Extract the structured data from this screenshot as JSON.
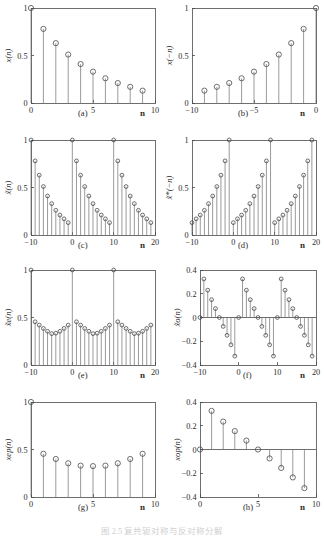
{
  "figure": {
    "caption": "图 2.5  复共轭对称与反对称分解",
    "xaxis_label": "n"
  },
  "panels": [
    {
      "id": "a",
      "sublabel": "(a)",
      "ylabel": "x(n)",
      "xlabel": "n",
      "xticks": [
        0,
        5,
        10
      ],
      "xticklabels": [
        "0",
        "5",
        "10"
      ],
      "yticks": [
        0,
        0.5,
        1
      ],
      "yticklabels": [
        "0",
        "0.5",
        "1"
      ],
      "xlim": [
        0,
        10
      ],
      "ylim": [
        0,
        1
      ]
    },
    {
      "id": "b",
      "sublabel": "(b)",
      "ylabel": "x(−n)",
      "xlabel": "n",
      "xticks": [
        -10,
        -5,
        0
      ],
      "xticklabels": [
        "−10",
        "−5",
        "0"
      ],
      "yticks": [
        0,
        0.5,
        1
      ],
      "yticklabels": [
        "0",
        "0.5",
        "1"
      ],
      "xlim": [
        -10,
        0
      ],
      "ylim": [
        0,
        1
      ]
    },
    {
      "id": "c",
      "sublabel": "(c)",
      "ylabel": "x̃(n)",
      "xlabel": "n",
      "xticks": [
        -10,
        0,
        10,
        20
      ],
      "xticklabels": [
        "−10",
        "0",
        "10",
        "20"
      ],
      "yticks": [
        0,
        0.5,
        1
      ],
      "yticklabels": [
        "0",
        "0.5",
        "1"
      ],
      "xlim": [
        -10,
        20
      ],
      "ylim": [
        0,
        1
      ]
    },
    {
      "id": "d",
      "sublabel": "(d)",
      "ylabel": "x̃*(−n)",
      "xlabel": "n",
      "xticks": [
        -10,
        0,
        10,
        20
      ],
      "xticklabels": [
        "−10",
        "0",
        "10",
        "20"
      ],
      "yticks": [
        0,
        0.5,
        1
      ],
      "yticklabels": [
        "0",
        "0.5",
        "1"
      ],
      "xlim": [
        -10,
        20
      ],
      "ylim": [
        0,
        1
      ]
    },
    {
      "id": "e",
      "sublabel": "(e)",
      "ylabel": "x̃e(n)",
      "xlabel": "n",
      "xticks": [
        -10,
        0,
        10,
        20
      ],
      "xticklabels": [
        "−10",
        "0",
        "10",
        "20"
      ],
      "yticks": [
        0,
        0.5,
        1
      ],
      "yticklabels": [
        "0",
        "0.5",
        "1"
      ],
      "xlim": [
        -10,
        20
      ],
      "ylim": [
        0,
        1
      ]
    },
    {
      "id": "f",
      "sublabel": "(f)",
      "ylabel": "x̃o(n)",
      "xlabel": "n",
      "xticks": [
        -10,
        0,
        10,
        20
      ],
      "xticklabels": [
        "−10",
        "0",
        "10",
        "20"
      ],
      "yticks": [
        -0.4,
        -0.2,
        0,
        0.2,
        0.4
      ],
      "yticklabels": [
        "−0.4",
        "−0.2",
        "0",
        "0.2",
        "0.4"
      ],
      "xlim": [
        -10,
        20
      ],
      "ylim": [
        -0.4,
        0.4
      ]
    },
    {
      "id": "g",
      "sublabel": "(g)",
      "ylabel": "xep(n)",
      "xlabel": "n",
      "xticks": [
        0,
        5,
        10
      ],
      "xticklabels": [
        "0",
        "5",
        "10"
      ],
      "yticks": [
        0,
        0.5,
        1
      ],
      "yticklabels": [
        "0",
        "0.5",
        "1"
      ],
      "xlim": [
        0,
        10
      ],
      "ylim": [
        0,
        1
      ]
    },
    {
      "id": "h",
      "sublabel": "(h)",
      "ylabel": "xop(n)",
      "xlabel": "n",
      "xticks": [
        0,
        5,
        10
      ],
      "xticklabels": [
        "0",
        "5",
        "10"
      ],
      "yticks": [
        -0.4,
        -0.2,
        0,
        0.2,
        0.4
      ],
      "yticklabels": [
        "−0.4",
        "−0.2",
        "0",
        "0.2",
        "0.4"
      ],
      "xlim": [
        0,
        10
      ],
      "ylim": [
        -0.4,
        0.4
      ]
    }
  ],
  "chart_data": [
    {
      "type": "stem",
      "panel": "a",
      "title": "(a)",
      "xlabel": "n",
      "ylabel": "x(n)",
      "xlim": [
        0,
        10
      ],
      "ylim": [
        0,
        1
      ],
      "grid": false,
      "x": [
        0,
        1,
        2,
        3,
        4,
        5,
        6,
        7,
        8,
        9
      ],
      "values": [
        1.0,
        0.78,
        0.63,
        0.51,
        0.41,
        0.33,
        0.26,
        0.21,
        0.17,
        0.13
      ]
    },
    {
      "type": "stem",
      "panel": "b",
      "title": "(b)",
      "xlabel": "n",
      "ylabel": "x(−n)",
      "xlim": [
        -10,
        0
      ],
      "ylim": [
        0,
        1
      ],
      "grid": false,
      "x": [
        -9,
        -8,
        -7,
        -6,
        -5,
        -4,
        -3,
        -2,
        -1,
        0
      ],
      "values": [
        0.13,
        0.17,
        0.21,
        0.26,
        0.33,
        0.41,
        0.51,
        0.63,
        0.78,
        1.0
      ]
    },
    {
      "type": "stem",
      "panel": "c",
      "title": "(c)",
      "xlabel": "n",
      "ylabel": "x̃(n)",
      "xlim": [
        -10,
        20
      ],
      "ylim": [
        0,
        1
      ],
      "grid": false,
      "x": [
        -10,
        -9,
        -8,
        -7,
        -6,
        -5,
        -4,
        -3,
        -2,
        -1,
        0,
        1,
        2,
        3,
        4,
        5,
        6,
        7,
        8,
        9,
        10,
        11,
        12,
        13,
        14,
        15,
        16,
        17,
        18,
        19
      ],
      "values": [
        1.0,
        0.78,
        0.63,
        0.51,
        0.41,
        0.33,
        0.26,
        0.21,
        0.17,
        0.13,
        1.0,
        0.78,
        0.63,
        0.51,
        0.41,
        0.33,
        0.26,
        0.21,
        0.17,
        0.13,
        1.0,
        0.78,
        0.63,
        0.51,
        0.41,
        0.33,
        0.26,
        0.21,
        0.17,
        0.13
      ]
    },
    {
      "type": "stem",
      "panel": "d",
      "title": "(d)",
      "xlabel": "n",
      "ylabel": "x̃*(−n)",
      "xlim": [
        -10,
        20
      ],
      "ylim": [
        0,
        1
      ],
      "grid": false,
      "x": [
        -10,
        -9,
        -8,
        -7,
        -6,
        -5,
        -4,
        -3,
        -2,
        -1,
        0,
        1,
        2,
        3,
        4,
        5,
        6,
        7,
        8,
        9,
        10,
        11,
        12,
        13,
        14,
        15,
        16,
        17,
        18,
        19
      ],
      "values": [
        0.13,
        0.17,
        0.21,
        0.26,
        0.33,
        0.41,
        0.51,
        0.63,
        0.78,
        1.0,
        0.13,
        0.17,
        0.21,
        0.26,
        0.33,
        0.41,
        0.51,
        0.63,
        0.78,
        1.0,
        0.13,
        0.17,
        0.21,
        0.26,
        0.33,
        0.41,
        0.51,
        0.63,
        0.78,
        1.0
      ]
    },
    {
      "type": "stem",
      "panel": "e",
      "title": "(e)",
      "xlabel": "n",
      "ylabel": "x̃e(n)",
      "xlim": [
        -10,
        20
      ],
      "ylim": [
        0,
        1
      ],
      "grid": false,
      "x": [
        -10,
        -9,
        -8,
        -7,
        -6,
        -5,
        -4,
        -3,
        -2,
        -1,
        0,
        1,
        2,
        3,
        4,
        5,
        6,
        7,
        8,
        9,
        10,
        11,
        12,
        13,
        14,
        15,
        16,
        17,
        18,
        19
      ],
      "values": [
        1.0,
        0.455,
        0.42,
        0.385,
        0.355,
        0.33,
        0.335,
        0.355,
        0.385,
        0.42,
        1.0,
        0.455,
        0.42,
        0.385,
        0.355,
        0.33,
        0.335,
        0.355,
        0.385,
        0.42,
        1.0,
        0.455,
        0.42,
        0.385,
        0.355,
        0.33,
        0.335,
        0.355,
        0.385,
        0.42
      ]
    },
    {
      "type": "stem",
      "panel": "f",
      "title": "(f)",
      "xlabel": "n",
      "ylabel": "x̃o(n)",
      "xlim": [
        -10,
        20
      ],
      "ylim": [
        -0.4,
        0.4
      ],
      "grid": false,
      "x": [
        -10,
        -9,
        -8,
        -7,
        -6,
        -5,
        -4,
        -3,
        -2,
        -1,
        0,
        1,
        2,
        3,
        4,
        5,
        6,
        7,
        8,
        9,
        10,
        11,
        12,
        13,
        14,
        15,
        16,
        17,
        18,
        19
      ],
      "values": [
        0.0,
        0.325,
        0.23,
        0.15,
        0.075,
        0.0,
        -0.075,
        -0.15,
        -0.23,
        -0.325,
        0.0,
        0.325,
        0.23,
        0.15,
        0.075,
        0.0,
        -0.075,
        -0.15,
        -0.23,
        -0.325,
        0.0,
        0.325,
        0.23,
        0.15,
        0.075,
        0.0,
        -0.075,
        -0.15,
        -0.23,
        -0.325
      ]
    },
    {
      "type": "stem",
      "panel": "g",
      "title": "(g)",
      "xlabel": "n",
      "ylabel": "xep(n)",
      "xlim": [
        0,
        10
      ],
      "ylim": [
        0,
        1
      ],
      "grid": false,
      "x": [
        0,
        1,
        2,
        3,
        4,
        5,
        6,
        7,
        8,
        9
      ],
      "values": [
        1.0,
        0.455,
        0.4,
        0.355,
        0.33,
        0.325,
        0.33,
        0.355,
        0.4,
        0.455
      ]
    },
    {
      "type": "stem",
      "panel": "h",
      "title": "(h)",
      "xlabel": "n",
      "ylabel": "xop(n)",
      "xlim": [
        0,
        10
      ],
      "ylim": [
        -0.4,
        0.4
      ],
      "grid": false,
      "x": [
        0,
        1,
        2,
        3,
        4,
        5,
        6,
        7,
        8,
        9
      ],
      "values": [
        0.0,
        0.325,
        0.235,
        0.155,
        0.075,
        0.0,
        -0.075,
        -0.155,
        -0.235,
        -0.325
      ]
    }
  ]
}
